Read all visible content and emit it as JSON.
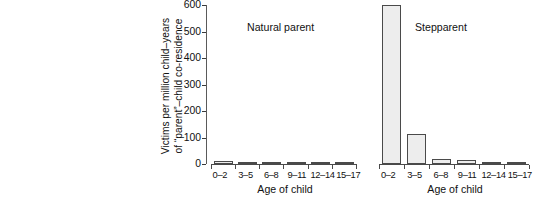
{
  "caption": {
    "lines": [
      {
        "text": "o children of being",
        "bold": true
      },
      {
        "text": "rent versus a stepparent",
        "bold": true
      },
      {
        "text": "gical parents (left) and",
        "bold": false
      },
      {
        "text": "e at which parents killed",
        "bold": false
      },
      {
        "text": "ides per million child-years",
        "bold": false
      },
      {
        "text": "pent living in the same",
        "bold": false
      },
      {
        "text": " or younger are killed by",
        "bold": false
      },
      {
        "text": " 70 times higher than such",
        "bold": false
      },
      {
        "text": "gical parents. The data are",
        "bold": false
      },
      {
        "text": "974 through 1983. From",
        "bold": false
      },
      {
        "text": "988b). Copyright © 1988,",
        "bold": false
      },
      {
        "text": "d by permission of Aldine",
        "bold": false
      }
    ]
  },
  "chart_data": {
    "type": "bar",
    "title": "",
    "xlabel": "Age of child",
    "ylabel": "Victims per million child-years of “parent”–child co-residence",
    "ylabel_line1": "Victims per million child–years",
    "ylabel_line2": "of “parent”–child co-residence",
    "categories": [
      "0–2",
      "3–5",
      "6–8",
      "9–11",
      "12–14",
      "15–17"
    ],
    "ylim": [
      0,
      600
    ],
    "yticks": [
      0,
      100,
      200,
      300,
      400,
      500,
      600
    ],
    "grid": false,
    "legend": "none",
    "panels": [
      {
        "name": "Natural parent",
        "values": [
          11,
          7,
          6,
          3,
          2,
          1
        ]
      },
      {
        "name": "Stepparent",
        "values": [
          600,
          115,
          19,
          14,
          9,
          6
        ]
      }
    ]
  },
  "colors": {
    "bar_fill": "#ededed",
    "bar_stroke": "#4a4a4a",
    "axis": "#4a4a4a",
    "text": "#111111",
    "background": "#ffffff"
  }
}
